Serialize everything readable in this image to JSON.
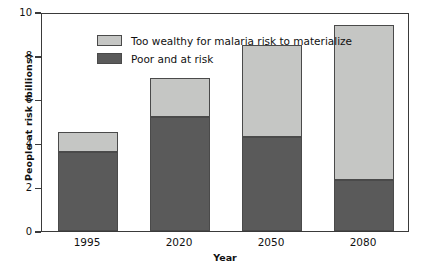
{
  "chart_data": {
    "type": "bar",
    "subtype": "stacked-vertical",
    "title": "",
    "xlabel": "Year",
    "ylabel": "People at risk (billions)",
    "categories": [
      "1995",
      "2020",
      "2050",
      "2080"
    ],
    "ylim": [
      0,
      10
    ],
    "yticks": [
      "0",
      "2",
      "4",
      "6",
      "8",
      "10"
    ],
    "ytick_values": [
      0,
      2,
      4,
      6,
      8,
      10
    ],
    "grid": false,
    "legend_position": "top-left inside plot",
    "series": [
      {
        "name": "Poor and at risk",
        "color": "#5a5a5a",
        "values": [
          3.6,
          5.2,
          4.3,
          2.35
        ]
      },
      {
        "name": "Too wealthy for malaria risk to materialize",
        "color": "#c5c6c4",
        "values": [
          0.9,
          1.8,
          4.2,
          7.05
        ]
      }
    ],
    "totals": [
      4.5,
      7.0,
      8.5,
      9.4
    ]
  },
  "legend": {
    "items": [
      {
        "label": "Too wealthy for malaria risk to materialize",
        "color": "#c5c6c4"
      },
      {
        "label": "Poor and at risk",
        "color": "#5a5a5a"
      }
    ]
  },
  "colors": {
    "wealthy": "#c5c6c4",
    "poor": "#5a5a5a",
    "axis": "#3a3a3a",
    "bar_edge": "#4a4a4a",
    "background": "#ffffff"
  }
}
